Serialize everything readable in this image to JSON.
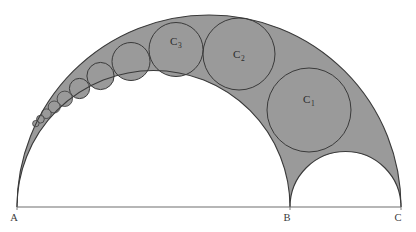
{
  "figure": {
    "type": "geometry-diagram",
    "name": "arbelos-with-pappus-chain",
    "background_color": "#ffffff",
    "shaded_color": "#9a9a9a",
    "stroke_color": "#3a3a3a",
    "baseline_color": "#6e6e6e",
    "width": 416,
    "height": 232
  },
  "points": [
    {
      "id": "A",
      "label": "A",
      "x": 17,
      "y": 207,
      "label_x": 14,
      "label_y": 221
    },
    {
      "id": "B",
      "label": "B",
      "x": 290,
      "y": 207,
      "label_x": 287,
      "label_y": 221
    },
    {
      "id": "C",
      "label": "C",
      "x": 401,
      "y": 207,
      "label_x": 398,
      "label_y": 221
    }
  ],
  "baseline": {
    "x1": 17,
    "y1": 207,
    "x2": 401,
    "y2": 207
  },
  "semicircles": [
    {
      "id": "AC",
      "name": "outer-semicircle-AC",
      "cx": 209,
      "cy": 207,
      "r": 192
    },
    {
      "id": "AB",
      "name": "inner-semicircle-AB",
      "cx": 153.5,
      "cy": 207,
      "r": 136.5
    },
    {
      "id": "BC",
      "name": "inner-semicircle-BC",
      "cx": 345.5,
      "cy": 207,
      "r": 55.5
    }
  ],
  "circles": [
    {
      "id": "c1",
      "label": "C",
      "sub": "1",
      "cx": 309.0,
      "cy": 110.0,
      "r": 42.0,
      "label_x": 303,
      "label_y": 103,
      "labelled": true
    },
    {
      "id": "c2",
      "label": "C",
      "sub": "2",
      "cx": 239.0,
      "cy": 54.0,
      "r": 36.0,
      "label_x": 233,
      "label_y": 58,
      "labelled": true
    },
    {
      "id": "c3",
      "label": "C",
      "sub": "3",
      "cx": 176.0,
      "cy": 49.5,
      "r": 27.0,
      "label_x": 170,
      "label_y": 45,
      "labelled": true
    },
    {
      "id": "c4",
      "label": "C",
      "sub": "4",
      "cx": 131.0,
      "cy": 61.5,
      "r": 19.0,
      "labelled": false
    },
    {
      "id": "c5",
      "label": "C",
      "sub": "5",
      "cx": 100.5,
      "cy": 76.0,
      "r": 13.6,
      "labelled": false
    },
    {
      "id": "c6",
      "label": "C",
      "sub": "6",
      "cx": 79.5,
      "cy": 88.5,
      "r": 10.1,
      "labelled": false
    },
    {
      "id": "c7",
      "label": "C",
      "sub": "7",
      "cx": 64.8,
      "cy": 98.8,
      "r": 7.7,
      "labelled": false
    },
    {
      "id": "c8",
      "label": "C",
      "sub": "8",
      "cx": 54.2,
      "cy": 107.0,
      "r": 6.0,
      "labelled": false
    },
    {
      "id": "c9",
      "label": "C",
      "sub": "9",
      "cx": 46.4,
      "cy": 113.7,
      "r": 4.8,
      "labelled": false
    },
    {
      "id": "c10",
      "label": "C",
      "sub": "10",
      "cx": 40.4,
      "cy": 119.2,
      "r": 3.9,
      "labelled": false
    },
    {
      "id": "c11",
      "label": "C",
      "sub": "11",
      "cx": 35.8,
      "cy": 123.6,
      "r": 3.2,
      "labelled": false
    }
  ],
  "labels": {
    "c1_text": "C",
    "c1_sub": "1",
    "c2_text": "C",
    "c2_sub": "2",
    "c3_text": "C",
    "c3_sub": "3",
    "point_a": "A",
    "point_b": "B",
    "point_c": "C"
  }
}
